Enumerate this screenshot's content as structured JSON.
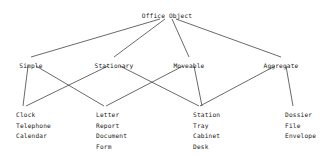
{
  "diagram": {
    "title": "Office Object",
    "root": {
      "id": "root",
      "label": "Office Object",
      "x": 167,
      "y": 12
    },
    "categories": [
      {
        "id": "simple",
        "label": "Simple",
        "x": 31,
        "y": 62
      },
      {
        "id": "stationary",
        "label": "Stationary",
        "x": 114,
        "y": 62
      },
      {
        "id": "moveable",
        "label": "Moveable",
        "x": 189,
        "y": 62
      },
      {
        "id": "aggregate",
        "label": "Aggregate",
        "x": 281,
        "y": 62
      }
    ],
    "leaf_groups": [
      {
        "id": "group-clock",
        "x": 16,
        "y": 110,
        "anchor_x": 23,
        "items": [
          "Clock",
          "Telephone",
          "Calendar"
        ]
      },
      {
        "id": "group-letter",
        "x": 96,
        "y": 110,
        "anchor_x": 104,
        "items": [
          "Letter",
          "Report",
          "Document",
          "Form"
        ]
      },
      {
        "id": "group-station",
        "x": 193,
        "y": 110,
        "anchor_x": 200,
        "items": [
          "Station",
          "Tray",
          "Cabinet",
          "Desk"
        ]
      },
      {
        "id": "group-dossier",
        "x": 285,
        "y": 110,
        "anchor_x": 292,
        "items": [
          "Dossier",
          "File",
          "Envelope"
        ]
      }
    ],
    "edges": [
      {
        "id": "e-root-simple",
        "from": "root",
        "to": "simple",
        "x1": 160,
        "y1": 19,
        "x2": 31,
        "y2": 57
      },
      {
        "id": "e-root-stationary",
        "from": "root",
        "to": "stationary",
        "x1": 165,
        "y1": 19,
        "x2": 114,
        "y2": 57
      },
      {
        "id": "e-root-moveable",
        "from": "root",
        "to": "moveable",
        "x1": 172,
        "y1": 19,
        "x2": 189,
        "y2": 57
      },
      {
        "id": "e-root-aggregate",
        "from": "root",
        "to": "aggregate",
        "x1": 176,
        "y1": 19,
        "x2": 281,
        "y2": 57
      },
      {
        "id": "e-simple-clock",
        "from": "simple",
        "to": "group-clock",
        "x1": 28,
        "y1": 66,
        "x2": 23,
        "y2": 106
      },
      {
        "id": "e-simple-letter",
        "from": "simple",
        "to": "group-letter",
        "x1": 36,
        "y1": 66,
        "x2": 104,
        "y2": 106
      },
      {
        "id": "e-stat-clock",
        "from": "stationary",
        "to": "group-clock",
        "x1": 108,
        "y1": 66,
        "x2": 26,
        "y2": 106
      },
      {
        "id": "e-stat-station",
        "from": "stationary",
        "to": "group-station",
        "x1": 120,
        "y1": 66,
        "x2": 199,
        "y2": 106
      },
      {
        "id": "e-move-letter",
        "from": "moveable",
        "to": "group-letter",
        "x1": 183,
        "y1": 66,
        "x2": 106,
        "y2": 106
      },
      {
        "id": "e-move-station",
        "from": "moveable",
        "to": "group-station",
        "x1": 194,
        "y1": 66,
        "x2": 202,
        "y2": 106
      },
      {
        "id": "e-agg-station",
        "from": "aggregate",
        "to": "group-station",
        "x1": 275,
        "y1": 66,
        "x2": 200,
        "y2": 106
      },
      {
        "id": "e-agg-dossier",
        "from": "aggregate",
        "to": "group-dossier",
        "x1": 286,
        "y1": 66,
        "x2": 293,
        "y2": 106
      }
    ],
    "style": {
      "line_color": "#2a2a2a",
      "text_color": "#1a1a1a",
      "background": "#ffffff"
    }
  }
}
